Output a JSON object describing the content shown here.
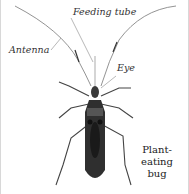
{
  "diagram": {
    "labels": {
      "feeding_tube": "Feeding tube",
      "antenna": "Antenna",
      "eye": "Eye"
    },
    "title_line1": "Plant-eating",
    "title_line2": "bug"
  }
}
